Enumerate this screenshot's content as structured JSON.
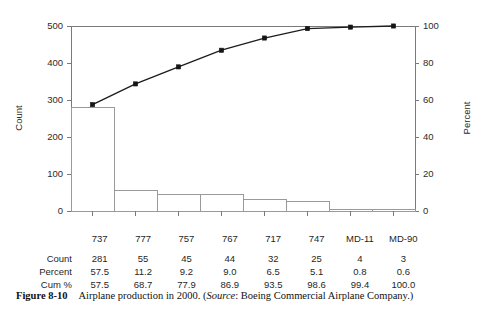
{
  "figure": {
    "number_label": "Figure 8-10",
    "caption_main": "Airplane production in 2000. (",
    "caption_source_word": "Source",
    "caption_tail": ": Boeing Commercial Airplane Company.)"
  },
  "chart_data": {
    "type": "bar",
    "title": "",
    "subtitle": "",
    "categories": [
      "737",
      "777",
      "757",
      "767",
      "717",
      "747",
      "MD-11",
      "MD-90"
    ],
    "values": [
      281,
      55,
      45,
      44,
      32,
      25,
      4,
      3
    ],
    "series": [
      {
        "name": "Count",
        "type": "bar",
        "axis": "left",
        "values": [
          281,
          55,
          45,
          44,
          32,
          25,
          4,
          3
        ]
      },
      {
        "name": "Cum %",
        "type": "line",
        "axis": "right",
        "values": [
          57.5,
          68.7,
          77.9,
          86.9,
          93.5,
          98.6,
          99.4,
          100.0
        ]
      }
    ],
    "xlabel": "",
    "ylabel": "Count",
    "y2label": "Percent",
    "ylim": [
      0,
      500
    ],
    "y2lim": [
      0,
      100
    ],
    "yticks": [
      0,
      100,
      200,
      300,
      400,
      500
    ],
    "yticklabels": [
      "0",
      "100",
      "200",
      "300",
      "400",
      "500"
    ],
    "y2ticks": [
      0,
      20,
      40,
      60,
      80,
      100
    ],
    "y2ticklabels": [
      "0",
      "20",
      "40",
      "60",
      "80",
      "100"
    ],
    "grid": false,
    "legend": "none",
    "bar_fill": "#ffffff",
    "bar_stroke": "#9a9a9a",
    "line_color": "#1c1c1c",
    "axis_color": "#7a7a7a"
  },
  "table": {
    "row_labels": [
      "Count",
      "Percent",
      "Cum %"
    ],
    "columns": [
      "737",
      "777",
      "757",
      "767",
      "717",
      "747",
      "MD-11",
      "MD-90"
    ],
    "rows": [
      {
        "label": "Count",
        "cells": [
          "281",
          "55",
          "45",
          "44",
          "32",
          "25",
          "4",
          "3"
        ]
      },
      {
        "label": "Percent",
        "cells": [
          "57.5",
          "11.2",
          "9.2",
          "9.0",
          "6.5",
          "5.1",
          "0.8",
          "0.6"
        ]
      },
      {
        "label": "Cum %",
        "cells": [
          "57.5",
          "68.7",
          "77.9",
          "86.9",
          "93.5",
          "98.6",
          "99.4",
          "100.0"
        ]
      }
    ]
  }
}
